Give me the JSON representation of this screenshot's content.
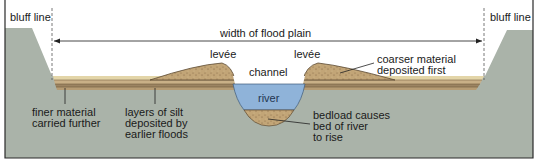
{
  "diagram": {
    "labels": {
      "bluff_line_left": "bluff line",
      "bluff_line_right": "bluff line",
      "width_of_flood_plain": "width of flood plain",
      "levee_left": "levée",
      "levee_right": "levée",
      "channel": "channel",
      "river": "river",
      "coarser_material": "coarser material\ndeposited first",
      "finer_material": "finer material\ncarried further",
      "layers_of_silt": "layers of silt\ndeposited by\nearlier floods",
      "bedload": "bedload causes\nbed of river\nto rise"
    },
    "colors": {
      "ground": "#aab3a9",
      "sediment": "#c2a577",
      "sediment_light": "#e3d5a8",
      "sediment_dark": "#8a6e4b",
      "water": "#8fb3d9",
      "frame": "#2a2a2a",
      "text": "#1a1a1a"
    }
  }
}
